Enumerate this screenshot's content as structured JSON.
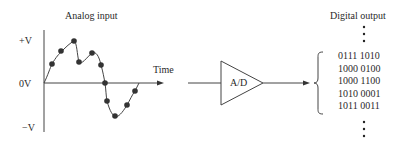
{
  "diagram": {
    "analog_title": "Analog input",
    "digital_title": "Digital output",
    "y_labels": {
      "pos": "+V",
      "zero": "0V",
      "neg": "−V"
    },
    "x_label": "Time",
    "converter_label": "A/D",
    "digital_codes": [
      "0111 1010",
      "1000 0100",
      "1000 1100",
      "1010 0001",
      "1011 0011"
    ],
    "ellipsis_top": "⋮",
    "ellipsis_bottom": "⋮",
    "sample_count": 13,
    "colors": {
      "line": "#444444",
      "dot": "#333333"
    }
  }
}
